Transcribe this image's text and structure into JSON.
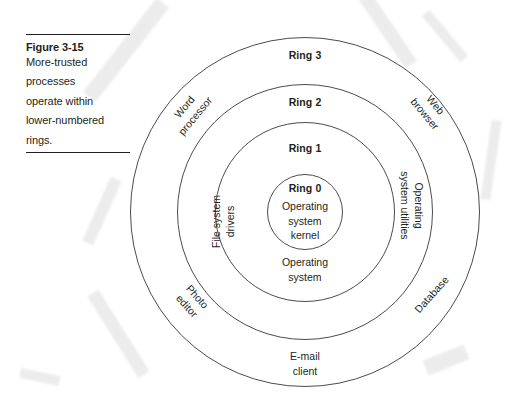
{
  "figure": {
    "caption_title": "Figure 3-15",
    "caption_lines": [
      "More-trusted",
      "processes",
      "operate within",
      "lower-numbered",
      "rings."
    ],
    "caption_text": "More-trusted processes operate within lower-numbered rings."
  },
  "diagram": {
    "type": "concentric-rings",
    "center": {
      "x": 305,
      "y": 212
    },
    "stroke_color": "#4b4b4b",
    "text_color": "#231f20",
    "background_color": "#ffffff",
    "rings": [
      {
        "id": "ring3",
        "number_label": "Ring 3",
        "radius": 175,
        "contents": [
          "Word processor",
          "Web browser",
          "Photo editor",
          "Database",
          "E-mail client"
        ]
      },
      {
        "id": "ring2",
        "number_label": "Ring 2",
        "radius": 128,
        "contents": [
          "Operating system utilities"
        ]
      },
      {
        "id": "ring1",
        "number_label": "Ring 1",
        "radius": 90,
        "contents": [
          "File system drivers",
          "Operating system"
        ]
      },
      {
        "id": "ring0",
        "number_label": "Ring 0",
        "radius": 38,
        "contents": [
          "Operating system kernel"
        ]
      }
    ],
    "labels": {
      "ring3_number": "Ring 3",
      "ring2_number": "Ring 2",
      "ring1_number": "Ring 1",
      "ring0_number": "Ring 0",
      "kernel_line1": "Operating",
      "kernel_line2": "system",
      "kernel_line3": "kernel",
      "os_line1": "Operating",
      "os_line2": "system",
      "email_line1": "E-mail",
      "email_line2": "client",
      "word_processor_line1": "Word",
      "word_processor_line2": "processor",
      "web_browser_line1": "Web",
      "web_browser_line2": "browser",
      "file_system_drivers_line1": "File system",
      "file_system_drivers_line2": "drivers",
      "os_utilities_line1": "Operating",
      "os_utilities_line2": "system utilities",
      "photo_editor_line1": "Photo",
      "photo_editor_line2": "editor",
      "database": "Database"
    }
  }
}
